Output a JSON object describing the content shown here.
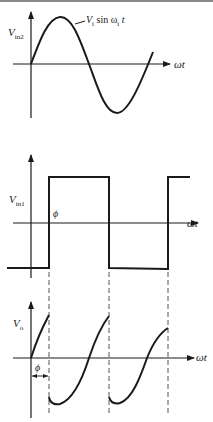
{
  "figure": {
    "panels": [
      {
        "id": "input-sine",
        "y_label": "V",
        "y_label_sub": "in2",
        "x_label": "ωt",
        "curve_label_main": "V",
        "curve_label_sub": "i",
        "curve_label_mid": " sin ω",
        "curve_label_sub2": "i",
        "curve_label_end": " t"
      },
      {
        "id": "input-square",
        "y_label": "V",
        "y_label_sub": "in1",
        "x_label": "ωt",
        "phase_label": "ϕ"
      },
      {
        "id": "output",
        "y_label": "V",
        "y_label_sub": "o",
        "x_label": "ωt",
        "phase_label": "ϕ"
      }
    ],
    "colors": {
      "stroke": "#1a1a1a",
      "background": "#ffffff",
      "dash": "#444444"
    }
  }
}
